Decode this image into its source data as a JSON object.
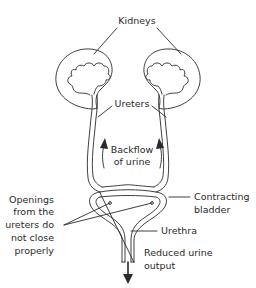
{
  "diagram": {
    "labels": {
      "kidneys": "Kidneys",
      "ureters": "Ureters",
      "backflow_line1": "Backflow",
      "backflow_line2": "of urine",
      "openings_line1": "Openings",
      "openings_line2": "from the",
      "openings_line3": "ureters do",
      "openings_line4": "not close",
      "openings_line5": "properly",
      "bladder_line1": "Contracting",
      "bladder_line2": "bladder",
      "urethra": "Urethra",
      "output_line1": "Reduced urine",
      "output_line2": "output"
    },
    "parts": [
      "left-kidney",
      "right-kidney",
      "left-ureter",
      "right-ureter",
      "bladder",
      "urethra"
    ],
    "arrows": [
      "backflow-left-arrow",
      "backflow-right-arrow",
      "urine-output-arrow"
    ],
    "colors": {
      "ink": "#2a2a2a",
      "background": "#ffffff"
    }
  }
}
